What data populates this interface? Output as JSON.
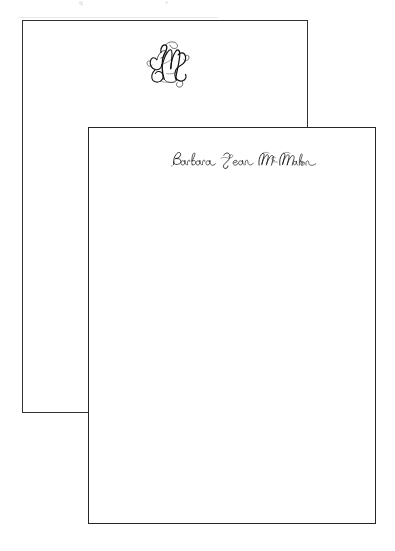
{
  "scene": {
    "background_color": "#ffffff",
    "description": "Two blank stationery note cards shown overlapping, the upper-left card printed with a three-letter interlocking script monogram and the lower-right card printed with a full name in engraved script."
  },
  "cards": [
    {
      "id": "back-card",
      "role": "monogram-card",
      "order": "behind",
      "border_color": "#333333",
      "fill_color": "#ffffff",
      "bounds": {
        "x": 22,
        "y": 20,
        "width": 286,
        "height": 393
      },
      "imprint": {
        "kind": "monogram",
        "style": "interlocking-vine-script",
        "ink_color": "#111111",
        "letters": [
          "B",
          "M",
          "J"
        ],
        "center_letter": "M",
        "text": "BMJ",
        "position": "top-center",
        "bounds": {
          "x": 142,
          "y": 32,
          "width": 49,
          "height": 60
        }
      }
    },
    {
      "id": "front-card",
      "role": "name-card",
      "order": "in-front",
      "border_color": "#262626",
      "fill_color": "#ffffff",
      "bounds": {
        "x": 88,
        "y": 127,
        "width": 288,
        "height": 397
      },
      "imprint": {
        "kind": "name",
        "style": "engraved-formal-script",
        "ink_color": "#111111",
        "text": "Barbara Jean McMahon",
        "words": [
          "Barbara",
          "Jean",
          "McMahon"
        ],
        "position": "top-center",
        "bounds": {
          "x": 155,
          "y": 148,
          "width": 160,
          "height": 20
        }
      }
    }
  ],
  "artifacts": {
    "label": "scan-speckles",
    "specks": [
      {
        "x": 80,
        "y": 2,
        "size": 4
      },
      {
        "x": 166,
        "y": 2,
        "size": 3
      },
      {
        "x": 82,
        "y": 4,
        "size": 2
      }
    ],
    "hairline_color": "#e9e9e9"
  }
}
